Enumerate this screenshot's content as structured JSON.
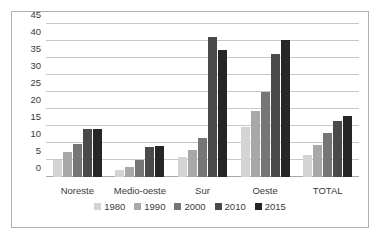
{
  "chart_data": {
    "type": "bar",
    "title": "",
    "subtitle": "",
    "xlabel": "",
    "ylabel": "",
    "categories": [
      "Noreste",
      "Medio-oeste",
      "Sur",
      "Oeste",
      "TOTAL"
    ],
    "series": [
      {
        "name": "1980",
        "color": "#d4d4d4",
        "values": [
          4.9,
          2.0,
          5.8,
          14.7,
          6.5
        ]
      },
      {
        "name": "1990",
        "color": "#a8a8a8",
        "values": [
          7.4,
          3.0,
          8.0,
          19.4,
          9.3
        ]
      },
      {
        "name": "2000",
        "color": "#767676",
        "values": [
          9.7,
          5.1,
          11.5,
          24.9,
          12.9
        ]
      },
      {
        "name": "2010",
        "color": "#4a4a4a",
        "values": [
          14.0,
          8.9,
          41.3,
          36.3,
          16.6
        ]
      },
      {
        "name": "2015",
        "color": "#262626",
        "values": [
          14.1,
          9.0,
          37.4,
          40.3,
          18.0
        ]
      }
    ],
    "ylim": [
      0,
      45
    ],
    "ytick_values": [
      0,
      5,
      10,
      15,
      20,
      25,
      30,
      35,
      40,
      45
    ],
    "ytick_labels": [
      "0",
      "5",
      "10",
      "15",
      "20",
      "25",
      "30",
      "35",
      "40",
      "45"
    ],
    "grid": true,
    "legend_position": "bottom"
  }
}
